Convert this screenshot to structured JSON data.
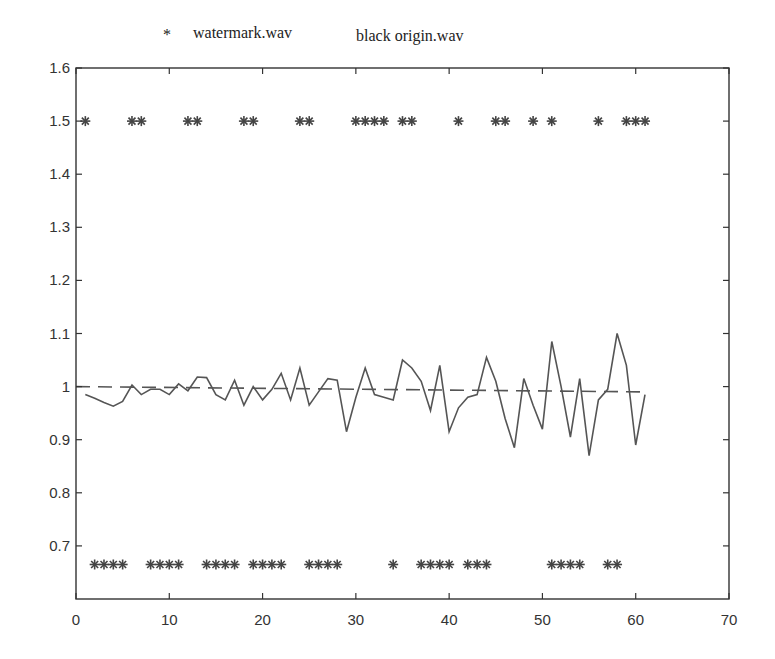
{
  "chart_data": {
    "type": "line",
    "title": "",
    "xlabel": "",
    "ylabel": "",
    "xlim": [
      0,
      70
    ],
    "ylim": [
      0.6,
      1.6
    ],
    "grid": false,
    "legend_position": "top, above axes",
    "xticks": [
      0,
      10,
      20,
      30,
      40,
      50,
      60,
      70
    ],
    "xtick_labels": [
      "0",
      "10",
      "20",
      "30",
      "40",
      "50",
      "60",
      "70"
    ],
    "yticks": [
      0.7,
      0.8,
      0.9,
      1.0,
      1.1,
      1.2,
      1.3,
      1.4,
      1.5,
      1.6
    ],
    "ytick_labels": [
      "0.7",
      "0.8",
      "0.9",
      "1",
      "1.1",
      "1.2",
      "1.3",
      "1.4",
      "1.5",
      "1.6"
    ],
    "legend": [
      {
        "marker": "*",
        "label": "watermark.wav"
      },
      {
        "marker": "",
        "label": "black origin.wav"
      }
    ],
    "series": [
      {
        "name": "watermark.wav (bit 1)",
        "style": "star-markers",
        "y_level": 1.5,
        "x": [
          1,
          6,
          7,
          12,
          13,
          18,
          19,
          24,
          25,
          30,
          31,
          32,
          33,
          35,
          36,
          41,
          45,
          46,
          49,
          51,
          56,
          59,
          60,
          61
        ]
      },
      {
        "name": "watermark.wav (bit 0)",
        "style": "star-markers",
        "y_level": 0.665,
        "x": [
          2,
          3,
          4,
          5,
          8,
          9,
          10,
          11,
          14,
          15,
          16,
          17,
          19,
          20,
          21,
          22,
          25,
          26,
          27,
          28,
          34,
          37,
          38,
          39,
          40,
          42,
          43,
          44,
          51,
          52,
          53,
          54,
          57,
          58
        ]
      },
      {
        "name": "reference",
        "style": "dashed-line",
        "x": [
          0,
          61
        ],
        "values": [
          1.0,
          0.99
        ]
      },
      {
        "name": "signal",
        "style": "solid-line",
        "x": [
          1,
          2,
          3,
          4,
          5,
          6,
          7,
          8,
          9,
          10,
          11,
          12,
          13,
          14,
          15,
          16,
          17,
          18,
          19,
          20,
          21,
          22,
          23,
          24,
          25,
          26,
          27,
          28,
          29,
          30,
          31,
          32,
          33,
          34,
          35,
          36,
          37,
          38,
          39,
          40,
          41,
          42,
          43,
          44,
          45,
          46,
          47,
          48,
          49,
          50,
          51,
          52,
          53,
          54,
          55,
          56,
          57,
          58,
          59,
          60,
          61
        ],
        "values": [
          0.985,
          0.978,
          0.97,
          0.963,
          0.972,
          1.003,
          0.985,
          0.995,
          0.995,
          0.985,
          1.005,
          0.992,
          1.018,
          1.017,
          0.985,
          0.975,
          1.012,
          0.965,
          1.0,
          0.975,
          0.995,
          1.025,
          0.975,
          1.035,
          0.965,
          0.99,
          1.015,
          1.012,
          0.915,
          0.98,
          1.035,
          0.985,
          0.98,
          0.975,
          1.05,
          1.035,
          1.01,
          0.955,
          1.04,
          0.915,
          0.96,
          0.98,
          0.985,
          1.055,
          1.01,
          0.94,
          0.885,
          1.015,
          0.965,
          0.92,
          1.085,
          1.0,
          0.905,
          1.015,
          0.87,
          0.975,
          0.995,
          1.1,
          1.04,
          0.89,
          0.985
        ]
      }
    ]
  }
}
